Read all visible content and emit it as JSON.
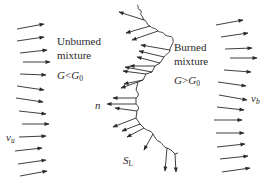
{
  "diagram": {
    "type": "flame-front-schematic",
    "colors": {
      "stroke": "#2a2a2a",
      "text": "#2a2a2a",
      "background": "#ffffff"
    },
    "labels": {
      "unburned_line1": "Unburned",
      "unburned_line2": "mixture",
      "unburned_cond_G": "G",
      "unburned_cond_op": "<",
      "unburned_cond_G0": "G",
      "unburned_cond_sub": "0",
      "burned_line1": "Burned",
      "burned_line2": "mixture",
      "burned_cond_G": "G",
      "burned_cond_op": ">",
      "burned_cond_G0": "G",
      "burned_cond_sub": "0",
      "normal": "n",
      "vu": "v",
      "vu_sub": "u",
      "vb": "v",
      "vb_sub": "b",
      "SL": "S",
      "SL_sub": "L"
    },
    "left_arrows": [
      {
        "x1": 17,
        "y1": 29,
        "x2": 44,
        "y2": 24
      },
      {
        "x1": 17,
        "y1": 41,
        "x2": 44,
        "y2": 37
      },
      {
        "x1": 20,
        "y1": 53,
        "x2": 47,
        "y2": 50
      },
      {
        "x1": 23,
        "y1": 62,
        "x2": 50,
        "y2": 62
      },
      {
        "x1": 20,
        "y1": 74,
        "x2": 46,
        "y2": 75
      },
      {
        "x1": 17,
        "y1": 86,
        "x2": 44,
        "y2": 90
      },
      {
        "x1": 16,
        "y1": 98,
        "x2": 43,
        "y2": 102
      },
      {
        "x1": 19,
        "y1": 111,
        "x2": 46,
        "y2": 114
      },
      {
        "x1": 22,
        "y1": 124,
        "x2": 49,
        "y2": 124
      },
      {
        "x1": 19,
        "y1": 137,
        "x2": 46,
        "y2": 136
      },
      {
        "x1": 15,
        "y1": 151,
        "x2": 42,
        "y2": 148
      },
      {
        "x1": 18,
        "y1": 164,
        "x2": 46,
        "y2": 160
      },
      {
        "x1": 20,
        "y1": 176,
        "x2": 47,
        "y2": 171
      }
    ],
    "right_arrows": [
      {
        "x1": 216,
        "y1": 25,
        "x2": 243,
        "y2": 20
      },
      {
        "x1": 221,
        "y1": 37,
        "x2": 248,
        "y2": 33
      },
      {
        "x1": 225,
        "y1": 49,
        "x2": 252,
        "y2": 48
      },
      {
        "x1": 230,
        "y1": 58,
        "x2": 257,
        "y2": 58
      },
      {
        "x1": 224,
        "y1": 70,
        "x2": 251,
        "y2": 72
      },
      {
        "x1": 218,
        "y1": 82,
        "x2": 246,
        "y2": 86
      },
      {
        "x1": 219,
        "y1": 95,
        "x2": 247,
        "y2": 100
      },
      {
        "x1": 217,
        "y1": 107,
        "x2": 244,
        "y2": 110
      },
      {
        "x1": 214,
        "y1": 120,
        "x2": 242,
        "y2": 120
      },
      {
        "x1": 216,
        "y1": 133,
        "x2": 244,
        "y2": 133
      },
      {
        "x1": 217,
        "y1": 147,
        "x2": 245,
        "y2": 144
      },
      {
        "x1": 220,
        "y1": 159,
        "x2": 248,
        "y2": 156
      },
      {
        "x1": 222,
        "y1": 172,
        "x2": 250,
        "y2": 168
      }
    ],
    "front_path": "M 137 5 C 140 6, 136 9, 140 10 C 143 11, 139 14, 142 16 L 144 20 C 148 21, 146 25, 150 26 C 152 29, 155 27, 158 31 C 160 33, 163 31, 165 35 C 168 37, 173 35, 173 40 C 174 44, 170 46, 170 50 C 170 53, 166 54, 164 57 L 160 63 L 155 66 L 152 72 L 146 74 L 143 80 L 138 82 L 136 90 C 138 93, 140 95, 136 98 L 136 104 C 138 106, 140 108, 137 111 L 136 118 L 140 124 L 144 128 C 147 131, 151 130, 153 134 C 155 138, 157 141, 160 142 C 163 144, 164 148, 167 148 L 171 150 L 175 154 L 178 153",
    "front_arrows": [
      {
        "x1": 144,
        "y1": 20,
        "x2": 119,
        "y2": 12
      },
      {
        "x1": 150,
        "y1": 26,
        "x2": 126,
        "y2": 33
      },
      {
        "x1": 158,
        "y1": 31,
        "x2": 132,
        "y2": 40
      },
      {
        "x1": 170,
        "y1": 50,
        "x2": 141,
        "y2": 45
      },
      {
        "x1": 164,
        "y1": 57,
        "x2": 139,
        "y2": 51
      },
      {
        "x1": 160,
        "y1": 63,
        "x2": 137,
        "y2": 57
      },
      {
        "x1": 155,
        "y1": 66,
        "x2": 130,
        "y2": 66
      },
      {
        "x1": 152,
        "y1": 72,
        "x2": 125,
        "y2": 67
      },
      {
        "x1": 146,
        "y1": 74,
        "x2": 123,
        "y2": 71
      },
      {
        "x1": 143,
        "y1": 80,
        "x2": 124,
        "y2": 84
      },
      {
        "x1": 138,
        "y1": 82,
        "x2": 121,
        "y2": 88
      },
      {
        "x1": 136,
        "y1": 98,
        "x2": 113,
        "y2": 98
      },
      {
        "x1": 136,
        "y1": 104,
        "x2": 107,
        "y2": 104
      },
      {
        "x1": 137,
        "y1": 111,
        "x2": 115,
        "y2": 108
      },
      {
        "x1": 136,
        "y1": 118,
        "x2": 113,
        "y2": 127
      },
      {
        "x1": 140,
        "y1": 124,
        "x2": 122,
        "y2": 131
      },
      {
        "x1": 144,
        "y1": 128,
        "x2": 127,
        "y2": 137
      },
      {
        "x1": 153,
        "y1": 134,
        "x2": 144,
        "y2": 150
      },
      {
        "x1": 167,
        "y1": 148,
        "x2": 165,
        "y2": 171
      },
      {
        "x1": 175,
        "y1": 154,
        "x2": 176,
        "y2": 172
      }
    ]
  }
}
